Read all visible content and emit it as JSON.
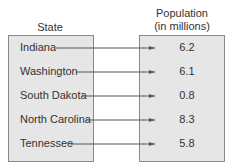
{
  "headers": {
    "domain": "State",
    "range_line1": "Population",
    "range_line2": "(in millions)"
  },
  "mapping": [
    {
      "state": "Indiana",
      "population": "6.2"
    },
    {
      "state": "Washington",
      "population": "6.1"
    },
    {
      "state": "South Dakota",
      "population": "0.8"
    },
    {
      "state": "North Carolina",
      "population": "8.3"
    },
    {
      "state": "Tennessee",
      "population": "5.8"
    }
  ],
  "colors": {
    "box_fill": "#e6e6e6",
    "box_border": "#8a8a8a",
    "arrow": "#555555",
    "text": "#333333"
  }
}
